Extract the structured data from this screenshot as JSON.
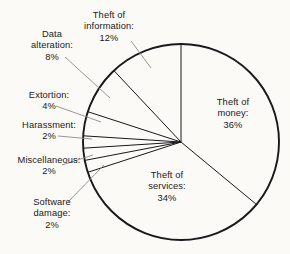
{
  "chart": {
    "type": "pie",
    "title": "",
    "background_color": "#fbfaf6",
    "stroke_color": "#19181a",
    "slice_fill": "none",
    "start_angle_deg": 0,
    "direction": "clockwise",
    "total": 100,
    "units": "percent"
  },
  "chart_data": {
    "type": "pie",
    "title": "",
    "subtitle": "",
    "xlabel": "",
    "ylabel": "",
    "legend_position": "none",
    "grid": false,
    "categories": [
      "Theft of money",
      "Theft of services",
      "Software damage",
      "Miscellaneous",
      "Harassment",
      "Extortion",
      "Data alteration",
      "Theft of information"
    ],
    "values": [
      36,
      34,
      2,
      2,
      2,
      4,
      8,
      12
    ],
    "labels": [
      "Theft of money: 36%",
      "Theft of services: 34%",
      "Software damage: 2%",
      "Miscellaneous: 2%",
      "Harassment: 2%",
      "Extortion: 4%",
      "Data alteration: 8%",
      "Theft of information: 12%"
    ],
    "slices": [
      {
        "name": "Theft of money",
        "value": 36,
        "value_text": "36%",
        "label_inside": true
      },
      {
        "name": "Theft of services",
        "value": 34,
        "value_text": "34%",
        "label_inside": true
      },
      {
        "name": "Software damage",
        "value": 2,
        "value_text": "2%",
        "label_inside": false
      },
      {
        "name": "Miscellaneous",
        "value": 2,
        "value_text": "2%",
        "label_inside": false
      },
      {
        "name": "Harassment",
        "value": 2,
        "value_text": "2%",
        "label_inside": false
      },
      {
        "name": "Extortion",
        "value": 4,
        "value_text": "4%",
        "label_inside": false
      },
      {
        "name": "Data alteration",
        "value": 8,
        "value_text": "8%",
        "label_inside": false
      },
      {
        "name": "Theft of information",
        "value": 12,
        "value_text": "12%",
        "label_inside": false
      }
    ]
  },
  "labels": {
    "theft_of_information": {
      "line1": "Theft of",
      "line2": "information:",
      "line3": "12%"
    },
    "data_alteration": {
      "line1": "Data",
      "line2": "alteration:",
      "line3": "8%"
    },
    "extortion": {
      "line1": "Extortion:",
      "line2": "4%"
    },
    "harassment": {
      "line1": "Harassment:",
      "line2": "2%"
    },
    "miscellaneous": {
      "line1": "Miscellaneous:",
      "line2": "2%"
    },
    "software_damage": {
      "line1": "Software",
      "line2": "damage:",
      "line3": "2%"
    },
    "theft_of_money": {
      "line1": "Theft of",
      "line2": "money:",
      "line3": "36%"
    },
    "theft_of_services": {
      "line1": "Theft of",
      "line2": "services:",
      "line3": "34%"
    }
  }
}
